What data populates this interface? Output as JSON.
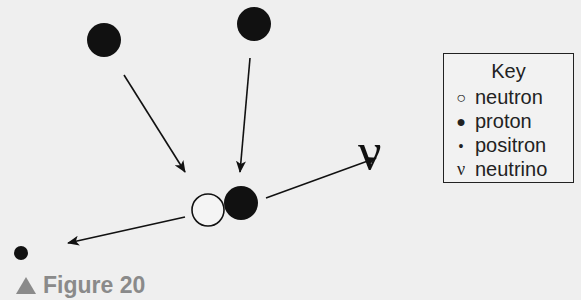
{
  "diagram": {
    "title_fragment": "",
    "neutrino_symbol": "ν",
    "particles": [
      {
        "type": "proton",
        "cx": 104,
        "cy": 40,
        "r": 17
      },
      {
        "type": "proton",
        "cx": 254,
        "cy": 24,
        "r": 17
      },
      {
        "type": "neutron",
        "cx": 208,
        "cy": 210,
        "r": 16
      },
      {
        "type": "proton",
        "cx": 241,
        "cy": 203,
        "r": 17
      },
      {
        "type": "positron",
        "cx": 21,
        "cy": 253,
        "r": 7
      }
    ]
  },
  "key": {
    "title": "Key",
    "items": [
      {
        "symbol": "○",
        "label": "neutron"
      },
      {
        "symbol": "●",
        "label": "proton"
      },
      {
        "symbol": "•",
        "label": "positron"
      },
      {
        "symbol": "ν",
        "label": "neutrino"
      }
    ]
  },
  "caption": {
    "label": "Figure 20"
  },
  "colors": {
    "background": "#efefef",
    "ink": "#111111",
    "caption": "#8a8a8a"
  }
}
